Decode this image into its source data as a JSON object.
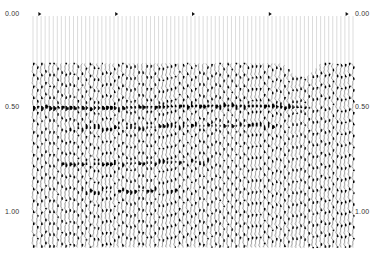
{
  "chart_data": {
    "type": "seismic-wiggle-section",
    "title": "",
    "xlabel": "",
    "ylabel": "Two-way time (s)",
    "ylim": [
      0.0,
      1.2
    ],
    "y_axis_left": {
      "ticks": [
        {
          "label": "0.00",
          "value": 0.0
        },
        {
          "label": "0.50",
          "value": 0.5
        },
        {
          "label": "1.00",
          "value": 1.0
        }
      ]
    },
    "y_axis_right": {
      "ticks": [
        {
          "label": "0.00",
          "value": 0.0
        },
        {
          "label": "0.50",
          "value": 0.5
        },
        {
          "label": "1.00",
          "value": 1.0
        }
      ]
    },
    "trace_count": 80,
    "shot_markers_x_fraction": [
      0.02,
      0.26,
      0.5,
      0.74,
      0.98
    ],
    "data_onset_time_s": 0.25,
    "strong_reflectors": [
      {
        "time_s": 0.47,
        "x_start": 0.0,
        "x_end": 0.85,
        "strength": "high"
      },
      {
        "time_s": 0.57,
        "x_start": 0.1,
        "x_end": 0.75,
        "strength": "medium"
      },
      {
        "time_s": 0.75,
        "x_start": 0.08,
        "x_end": 0.55,
        "strength": "medium"
      },
      {
        "time_s": 0.89,
        "x_start": 0.15,
        "x_end": 0.45,
        "strength": "medium"
      }
    ],
    "grid": false,
    "legend": null,
    "fill": "positive-lobe black"
  },
  "labels": {
    "left_000": "0.00",
    "left_050": "0.50",
    "left_100": "1.00",
    "right_000": "0.00",
    "right_050": "0.50",
    "right_100": "1.00"
  }
}
